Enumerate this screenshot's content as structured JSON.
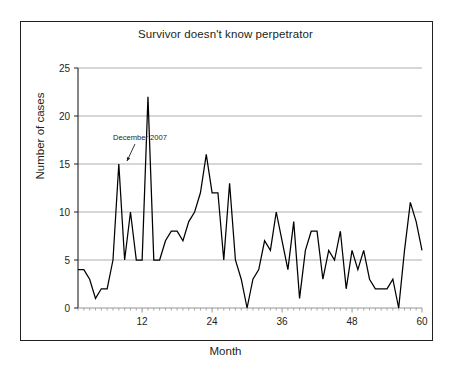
{
  "figure": {
    "background_color": "#ffffff",
    "frame_color": "#231f20",
    "gridline_color": "#9a9a9a",
    "series_color": "#000000"
  },
  "chart_data": {
    "type": "line",
    "title": "Survivor doesn't know perpetrator",
    "xlabel": "Month",
    "ylabel": "Number of cases",
    "xlim": [
      1,
      60
    ],
    "ylim": [
      0,
      25
    ],
    "xticks": [
      12,
      24,
      36,
      48,
      60
    ],
    "xtick_labels": [
      "12",
      "24",
      "36",
      "48",
      "60"
    ],
    "yticks": [
      0,
      5,
      10,
      15,
      20,
      25
    ],
    "ytick_labels": [
      "0",
      "5",
      "10",
      "15",
      "20",
      "25"
    ],
    "grid": "horizontal",
    "legend": "none",
    "annotations": [
      {
        "text": "December 2007",
        "x": 7,
        "y": 17.5,
        "arrow_to_x": 9.4,
        "arrow_to_y": 15.3
      }
    ],
    "x": [
      1,
      2,
      3,
      4,
      5,
      6,
      7,
      8,
      9,
      10,
      11,
      12,
      13,
      14,
      15,
      16,
      17,
      18,
      19,
      20,
      21,
      22,
      23,
      24,
      25,
      26,
      27,
      28,
      29,
      30,
      31,
      32,
      33,
      34,
      35,
      36,
      37,
      38,
      39,
      40,
      41,
      42,
      43,
      44,
      45,
      46,
      47,
      48,
      49,
      50,
      51,
      52,
      53,
      54,
      55,
      56,
      57,
      58,
      59,
      60
    ],
    "values": [
      4,
      4,
      3,
      1,
      2,
      2,
      5,
      15,
      5,
      10,
      5,
      5,
      22,
      5,
      5,
      7,
      8,
      8,
      7,
      9,
      10,
      12,
      16,
      12,
      12,
      5,
      13,
      5,
      3,
      0,
      3,
      4,
      7,
      6,
      10,
      7,
      4,
      9,
      1,
      6,
      8,
      8,
      3,
      6,
      5,
      8,
      2,
      6,
      4,
      6,
      3,
      2,
      2,
      2,
      3,
      0,
      6,
      11,
      9,
      6
    ],
    "series_name": "Number of cases"
  }
}
